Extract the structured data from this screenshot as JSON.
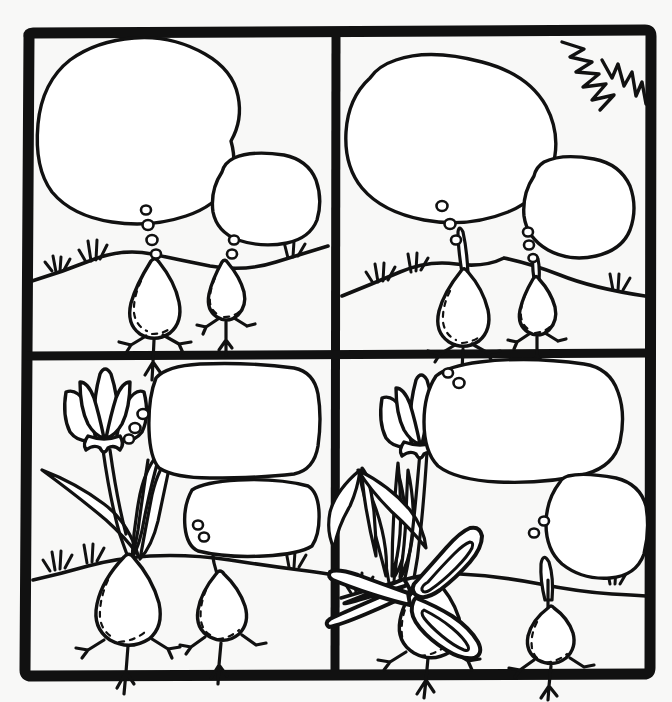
{
  "sheet": {
    "title": "Plant Growth Comic Strip Worksheet",
    "description": "Four-panel black-and-white line-art comic strip showing two seed bulbs underground with empty thought bubbles.",
    "background_color": "#f8f8f7",
    "ink_color": "#111111",
    "fill_color": "#ffffff",
    "width": 672,
    "height": 702,
    "panel_count": 4,
    "grid": "2x2"
  },
  "panels": [
    {
      "id": "panel-1",
      "position": "top-left",
      "caption": "",
      "characters": [
        {
          "name": "big-bulb",
          "label": "",
          "size": "large",
          "sprout": "none"
        },
        {
          "name": "small-bulb",
          "label": "",
          "size": "small",
          "sprout": "none"
        }
      ],
      "bubbles": [
        {
          "name": "thought-bubble-large",
          "text": "",
          "shape": "cloud",
          "dots": 4
        },
        {
          "name": "thought-bubble-small",
          "text": "",
          "shape": "cloud",
          "dots": 2
        }
      ],
      "props": []
    },
    {
      "id": "panel-2",
      "position": "top-right",
      "caption": "",
      "characters": [
        {
          "name": "big-bulb",
          "label": "",
          "size": "large",
          "sprout": "tall-thin"
        },
        {
          "name": "small-bulb",
          "label": "",
          "size": "small",
          "sprout": "short"
        }
      ],
      "bubbles": [
        {
          "name": "thought-bubble-large",
          "text": "",
          "shape": "oval",
          "dots": 3
        },
        {
          "name": "thought-bubble-small",
          "text": "",
          "shape": "oval",
          "dots": 3
        }
      ],
      "props": [
        {
          "name": "sun-burst-icon",
          "label": "",
          "corner": "top-right"
        }
      ]
    },
    {
      "id": "panel-3",
      "position": "bottom-left",
      "caption": "",
      "characters": [
        {
          "name": "big-bulb",
          "label": "",
          "size": "large",
          "sprout": "flower-with-leaves"
        },
        {
          "name": "small-bulb",
          "label": "",
          "size": "small",
          "sprout": "short-curved"
        }
      ],
      "bubbles": [
        {
          "name": "thought-bubble-large",
          "text": "",
          "shape": "rounded-rect",
          "dots": 3
        },
        {
          "name": "thought-bubble-small",
          "text": "",
          "shape": "rounded-rect",
          "dots": 2
        }
      ],
      "props": []
    },
    {
      "id": "panel-4",
      "position": "bottom-right",
      "caption": "",
      "characters": [
        {
          "name": "big-bulb",
          "label": "",
          "size": "large",
          "sprout": "flower-with-leaves"
        },
        {
          "name": "small-bulb",
          "label": "",
          "size": "small",
          "sprout": "pointed-bud"
        }
      ],
      "bubbles": [
        {
          "name": "thought-bubble-large",
          "text": "",
          "shape": "cloud",
          "dots": 2
        },
        {
          "name": "thought-bubble-small",
          "text": "",
          "shape": "cloud",
          "dots": 2
        }
      ],
      "props": [
        {
          "name": "scissors-icon",
          "label": "",
          "position": "cutting-flower-stem"
        }
      ]
    }
  ],
  "icons": {
    "flower": "tulip-icon",
    "bulb": "seed-bulb-icon",
    "grass": "grass-tuft-icon",
    "scissors": "scissors-icon",
    "sun": "sun-burst-icon",
    "bubble": "thought-bubble-icon"
  }
}
